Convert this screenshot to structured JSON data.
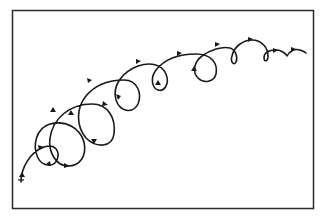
{
  "diagram": {
    "frame": {
      "x": 12,
      "y": 10,
      "width": 302,
      "height": 199,
      "stroke": "#2a2a2a"
    },
    "curve": {
      "stroke": "#1a1a1a",
      "start_point": [
        21,
        180
      ],
      "end_point": [
        306,
        53
      ],
      "loop_count": 10
    },
    "labels": []
  }
}
